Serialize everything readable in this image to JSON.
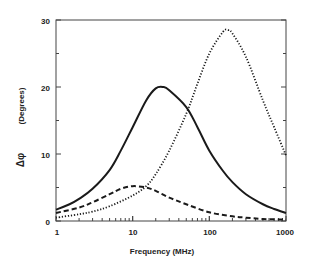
{
  "chart_data": {
    "type": "line",
    "title": "",
    "xlabel": "Frequency (MHz)",
    "ylabel": "Δφ (Degrees)",
    "xscale": "log",
    "xlim": [
      1,
      1000
    ],
    "ylim": [
      0,
      30
    ],
    "xticks": [
      "1",
      "10",
      "100",
      "1000"
    ],
    "yticks": [
      "0",
      "10",
      "20",
      "30"
    ],
    "grid": false,
    "legend": "none",
    "series": [
      {
        "name": "solid",
        "style": "solid",
        "x": [
          1,
          1.5,
          2,
          3,
          5,
          7,
          10,
          15,
          20,
          25,
          30,
          50,
          70,
          100,
          150,
          200,
          300,
          500,
          700,
          1000
        ],
        "y": [
          1.7,
          2.5,
          3.3,
          4.8,
          7.6,
          10.5,
          14,
          18,
          19.8,
          20,
          19.5,
          17,
          14,
          10.5,
          7.5,
          5.8,
          4,
          2.5,
          1.8,
          1.2
        ]
      },
      {
        "name": "dashed",
        "style": "dashed",
        "x": [
          1,
          2,
          3,
          5,
          7,
          10,
          15,
          20,
          30,
          50,
          100,
          200,
          300,
          500,
          1000
        ],
        "y": [
          1.2,
          2,
          2.8,
          4,
          4.8,
          5.2,
          5,
          4.5,
          3.5,
          2.5,
          1.3,
          0.7,
          0.5,
          0.3,
          0.2
        ]
      },
      {
        "name": "dotted",
        "style": "dotted",
        "x": [
          1,
          2,
          3,
          5,
          10,
          15,
          20,
          30,
          50,
          70,
          100,
          150,
          175,
          200,
          300,
          500,
          700,
          1000
        ],
        "y": [
          0.5,
          1,
          1.4,
          2.2,
          3.8,
          5.2,
          7,
          10.5,
          16,
          20.5,
          25,
          28.2,
          28.5,
          28,
          24.5,
          18,
          14,
          9.8
        ]
      }
    ]
  },
  "axes": {
    "x_title": "Frequency (MHz)",
    "y_title_symbol": "Δφ",
    "y_title_unit": "(Degrees)",
    "x_tick_labels": [
      "1",
      "10",
      "100",
      "1000"
    ],
    "y_tick_labels": [
      "0",
      "10",
      "20",
      "30"
    ]
  }
}
